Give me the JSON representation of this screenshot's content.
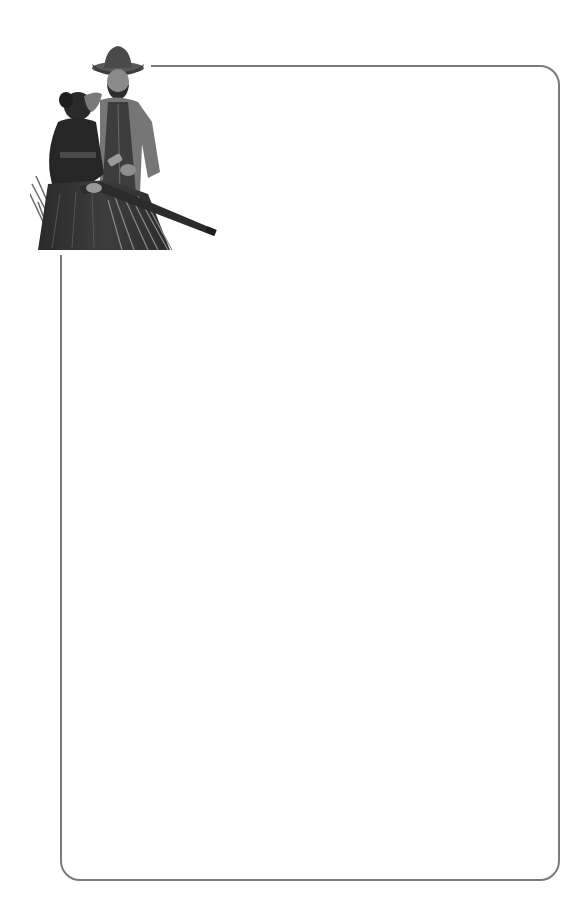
{
  "page": {
    "type": "stationery",
    "background_color": "#ffffff"
  },
  "frame": {
    "border_color": "#7b7b7b",
    "border_width_px": 2,
    "corner_radius_px": 20,
    "content": ""
  },
  "illustration": {
    "description": "Grayscale illustration of a cowboy in a hat and vest standing beside a woman in a dark dress holding a rifle, among tall grass",
    "icon": "cowboy-couple-illustration"
  }
}
